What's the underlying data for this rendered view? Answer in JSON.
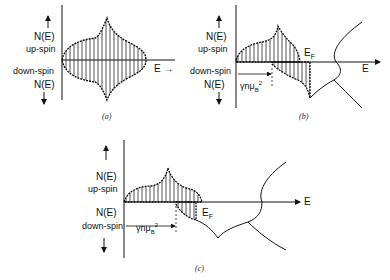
{
  "panels": [
    {
      "id": "a",
      "caption": "(a)",
      "labels": {
        "up_n": "N(E)",
        "up_spin": "up-spin",
        "down_spin": "down-spin",
        "down_n": "N(E)",
        "energy": "E"
      }
    },
    {
      "id": "b",
      "caption": "(b)",
      "labels": {
        "up_n": "N(E)",
        "up_spin": "up-spin",
        "down_spin": "down-spin",
        "down_n": "N(E)",
        "energy": "E",
        "fermi": "E",
        "fermi_sub": "F",
        "shift": "γnμ",
        "shift_sub": "B",
        "shift_sup": "2"
      }
    },
    {
      "id": "c",
      "caption": "(c)",
      "labels": {
        "up_n": "N(E)",
        "up_spin": "up-spin",
        "down_n": "N(E)",
        "down_spin": "down-spin",
        "energy": "E",
        "fermi": "E",
        "fermi_sub": "F",
        "shift": "γnμ",
        "shift_sub": "B",
        "shift_sup": "2"
      }
    }
  ]
}
